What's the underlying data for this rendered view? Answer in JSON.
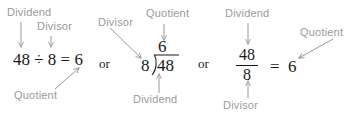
{
  "diagram": {
    "label_color": "#9a9a9a",
    "math_color": "#1a1a1a",
    "background": "#ffffff",
    "or_text_1": "or",
    "or_text_2": "or"
  },
  "form_inline": {
    "labels": {
      "dividend": "Dividend",
      "divisor": "Divisor",
      "quotient": "Quotient"
    },
    "expression": "48 ÷ 8 = 6",
    "dividend_value": "48",
    "divisor_value": "8",
    "quotient_value": "6"
  },
  "form_longdivision": {
    "labels": {
      "divisor": "Divisor",
      "quotient": "Quotient",
      "dividend": "Dividend"
    },
    "dividend_value": "48",
    "divisor_value": "8",
    "quotient_value": "6"
  },
  "form_fraction": {
    "labels": {
      "dividend": "Dividend",
      "divisor": "Divisor",
      "quotient": "Quotient"
    },
    "numerator": "48",
    "denominator": "8",
    "equals": "=",
    "quotient_value": "6"
  }
}
